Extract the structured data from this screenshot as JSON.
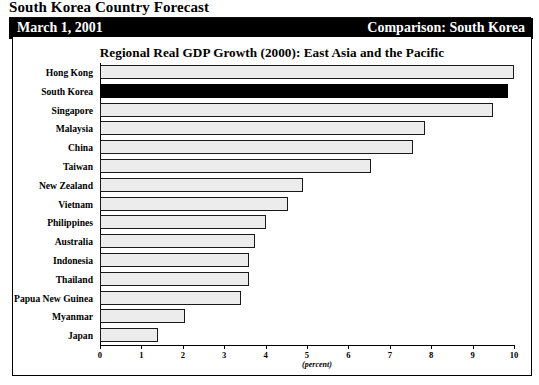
{
  "document": {
    "title": "South Korea Country Forecast",
    "date": "March 1, 2001",
    "comparison": "Comparison: South Korea"
  },
  "chart_data": {
    "type": "bar",
    "orientation": "horizontal",
    "title": "Regional Real GDP Growth (2000): East Asia and the Pacific",
    "xlabel": "(percent)",
    "ylabel": "",
    "xlim": [
      0,
      10
    ],
    "xticks": [
      "0",
      "1",
      "2",
      "3",
      "4",
      "5",
      "6",
      "7",
      "8",
      "9",
      "10"
    ],
    "grid": false,
    "legend": "none",
    "highlight_category": "South Korea",
    "highlight_color": "#000000",
    "bar_color": "#ececec",
    "bar_border_color": "#1a1a1a",
    "categories": [
      "Hong Kong",
      "South Korea",
      "Singapore",
      "Malaysia",
      "China",
      "Taiwan",
      "New Zealand",
      "Vietnam",
      "Philippines",
      "Australia",
      "Indonesia",
      "Thailand",
      "Papua New Guinea",
      "Myanmar",
      "Japan"
    ],
    "values": [
      10.0,
      9.85,
      9.5,
      7.85,
      7.55,
      6.55,
      4.9,
      4.55,
      4.0,
      3.75,
      3.6,
      3.6,
      3.4,
      2.05,
      1.4
    ]
  }
}
